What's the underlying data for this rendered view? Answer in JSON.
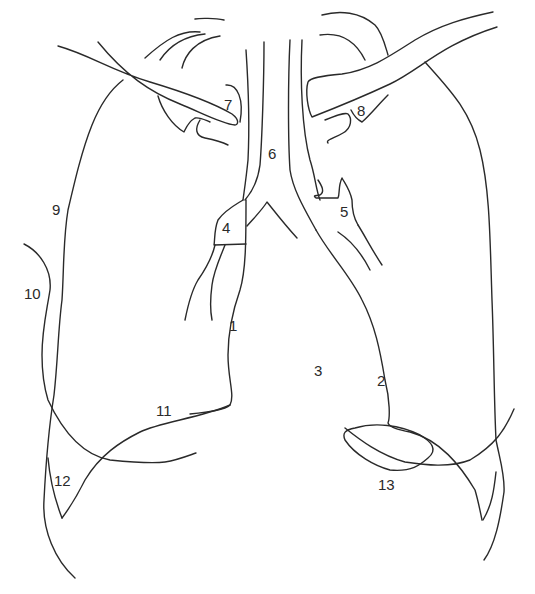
{
  "diagram": {
    "type": "anatomical line drawing (chest radiograph tracing)",
    "background": "#ffffff",
    "stroke_color": "#2a2a2a",
    "labels": [
      {
        "id": "1",
        "text": "1",
        "x": 229,
        "y": 331
      },
      {
        "id": "2",
        "text": "2",
        "x": 377,
        "y": 386
      },
      {
        "id": "3",
        "text": "3",
        "x": 314,
        "y": 376
      },
      {
        "id": "4",
        "text": "4",
        "x": 222,
        "y": 233
      },
      {
        "id": "5",
        "text": "5",
        "x": 340,
        "y": 217
      },
      {
        "id": "6",
        "text": "6",
        "x": 268,
        "y": 159
      },
      {
        "id": "7",
        "text": "7",
        "x": 224,
        "y": 110
      },
      {
        "id": "8",
        "text": "8",
        "x": 357,
        "y": 116
      },
      {
        "id": "9",
        "text": "9",
        "x": 52,
        "y": 215
      },
      {
        "id": "10",
        "text": "10",
        "x": 24,
        "y": 299
      },
      {
        "id": "11",
        "text": "11",
        "x": 156,
        "y": 416
      },
      {
        "id": "12",
        "text": "12",
        "x": 54,
        "y": 486
      },
      {
        "id": "13",
        "text": "13",
        "x": 378,
        "y": 490
      }
    ]
  }
}
